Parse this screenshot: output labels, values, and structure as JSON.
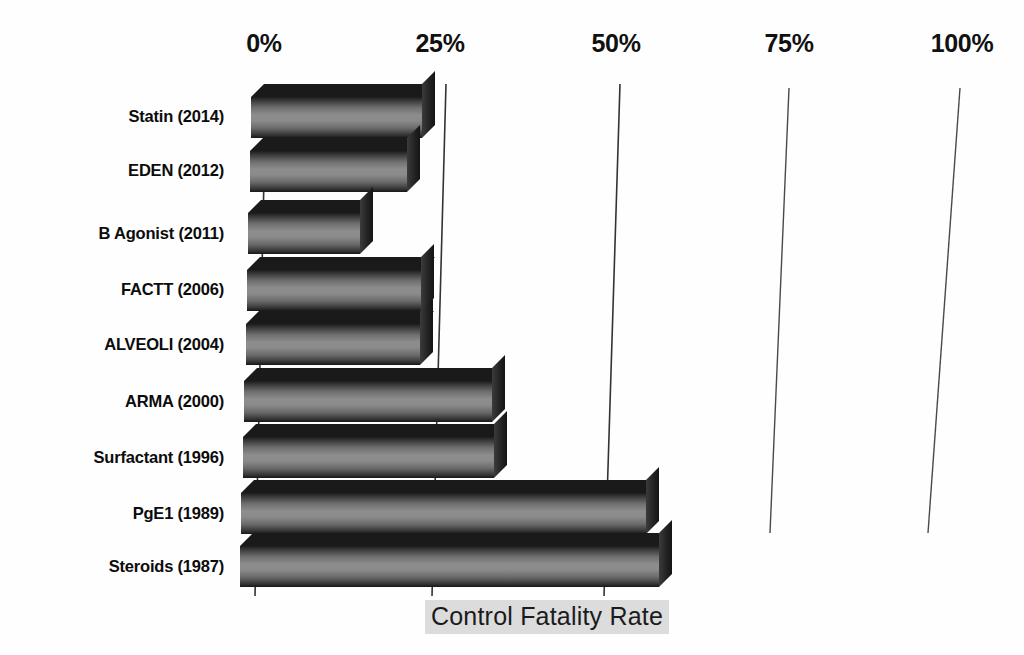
{
  "chart_data": {
    "type": "bar",
    "orientation": "horizontal",
    "title": "",
    "xlabel": "Control Fatality Rate",
    "ylabel": "",
    "xlim": [
      0,
      100
    ],
    "xtick_labels": [
      "0%",
      "25%",
      "50%",
      "75%",
      "100%"
    ],
    "xticks": [
      0,
      25,
      50,
      75,
      100
    ],
    "grid": true,
    "legend": null,
    "style_3d": true,
    "categories": [
      "Statin (2014)",
      "EDEN (2012)",
      "B Agonist (2011)",
      "FACTT (2006)",
      "ALVEOLI (2004)",
      "ARMA (2000)",
      "Surfactant (1996)",
      "PgE1 (1989)",
      "Steroids (1987)"
    ],
    "values": [
      24.5,
      22.5,
      16.0,
      25.0,
      25.0,
      35.5,
      36.0,
      58.0,
      60.0
    ],
    "value_unit": "%",
    "series": [
      {
        "name": "Control Fatality Rate",
        "values": [
          24.5,
          22.5,
          16.0,
          25.0,
          25.0,
          35.5,
          36.0,
          58.0,
          60.0
        ]
      }
    ]
  },
  "axis": {
    "ticks": [
      {
        "label": "0%",
        "value": 0,
        "x": 264
      },
      {
        "label": "25%",
        "value": 25,
        "x": 440
      },
      {
        "label": "50%",
        "value": 50,
        "x": 616
      },
      {
        "label": "75%",
        "value": 75,
        "x": 789
      },
      {
        "label": "100%",
        "value": 100,
        "x": 962
      }
    ],
    "title": "Control Fatality Rate"
  },
  "categories": [
    {
      "label": "Statin (2014)",
      "value": 24.5,
      "y": 117
    },
    {
      "label": "EDEN (2012)",
      "value": 22.5,
      "y": 171
    },
    {
      "label": "B Agonist (2011)",
      "value": 16.0,
      "y": 233
    },
    {
      "label": "FACTT (2006)",
      "value": 25.0,
      "y": 290
    },
    {
      "label": "ALVEOLI (2004)",
      "value": 25.0,
      "y": 344
    },
    {
      "label": "ARMA (2000)",
      "value": 35.5,
      "y": 401
    },
    {
      "label": "Surfactant (1996)",
      "value": 36.0,
      "y": 457
    },
    {
      "label": "PgE1 (1989)",
      "value": 58.0,
      "y": 513
    },
    {
      "label": "Steroids (1987)",
      "value": 60.0,
      "y": 566
    }
  ],
  "colors": {
    "background": "#fefefe",
    "bar_light": "#8d8d8d",
    "bar_dark": "#151515",
    "text": "#0c0c0c",
    "gridline": "#4a4a4a",
    "title_highlight": "#dcdcdc"
  }
}
